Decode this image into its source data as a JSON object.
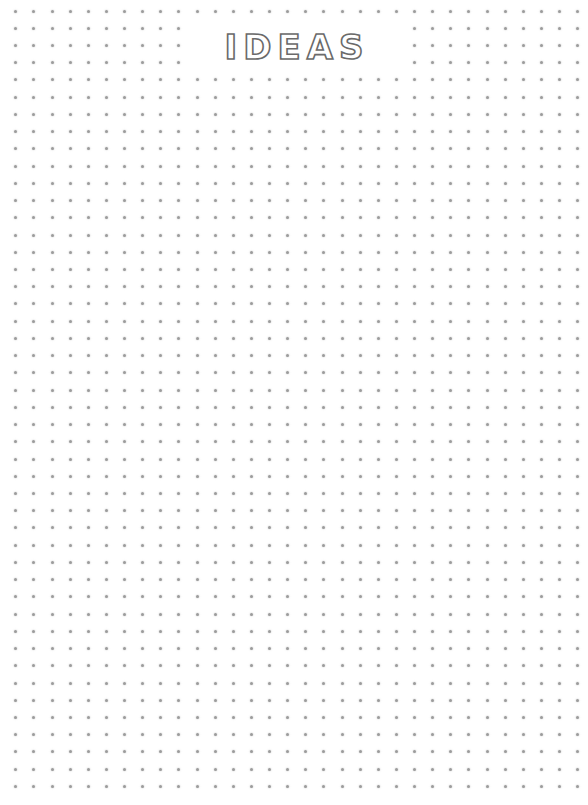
{
  "page": {
    "type": "dot-grid-notebook-page",
    "background_color": "#ffffff",
    "width": 588,
    "height": 805
  },
  "title": {
    "text": "IDEAS",
    "style": "outlined-dotted-doodle",
    "color": "#6a6a6a"
  },
  "grid": {
    "dot_color": "#9c9c9c",
    "columns": 32,
    "rows": 46,
    "origin_x": 15.7,
    "origin_y": 11,
    "spacing_x": 18.13,
    "spacing_y": 17.23,
    "hidden_region": {
      "x": 186,
      "y": 19,
      "width": 222,
      "height": 52
    }
  }
}
